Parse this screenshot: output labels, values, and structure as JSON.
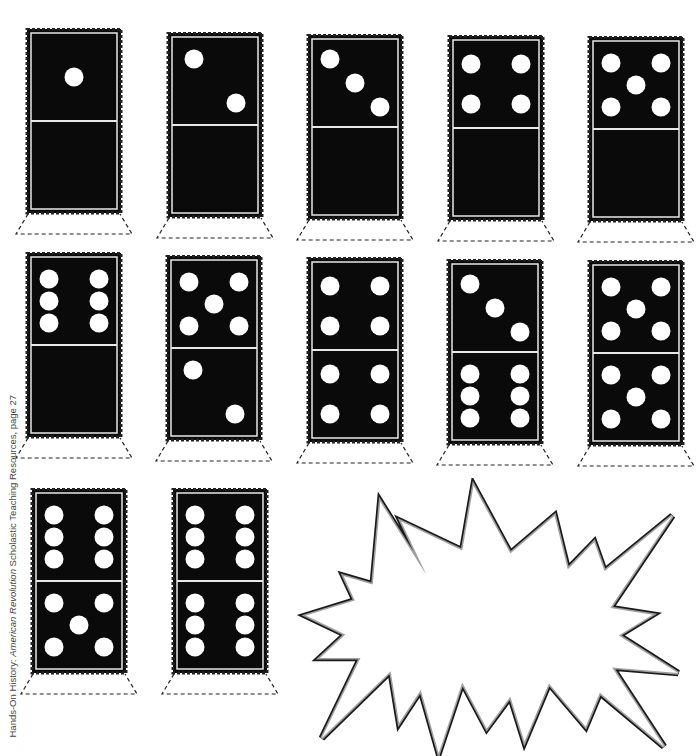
{
  "page": {
    "credit": {
      "prefix": "Hands-On History: ",
      "book": "American Revolution",
      "suffix": "  Scholastic Teaching Resources, page 27"
    }
  },
  "colors": {
    "tile": "#0a0a0a",
    "pip": "#ffffff",
    "divider": "#e8e8e8",
    "starburst_stroke": "#1a1a1a",
    "starburst_fill": "#9a9a9a"
  },
  "dominoes": [
    {
      "row": 1,
      "col": 1,
      "top": 1,
      "bottom": 0,
      "x": 26,
      "y": 28
    },
    {
      "row": 1,
      "col": 2,
      "top": 2,
      "bottom": 0,
      "x": 167,
      "y": 32
    },
    {
      "row": 1,
      "col": 3,
      "top": 3,
      "bottom": 0,
      "x": 307,
      "y": 34
    },
    {
      "row": 1,
      "col": 4,
      "top": 4,
      "bottom": 0,
      "x": 448,
      "y": 35
    },
    {
      "row": 1,
      "col": 5,
      "top": 5,
      "bottom": 0,
      "x": 588,
      "y": 36
    },
    {
      "row": 2,
      "col": 1,
      "top": 6,
      "bottom": 0,
      "x": 26,
      "y": 252
    },
    {
      "row": 2,
      "col": 2,
      "top": 5,
      "bottom": 2,
      "x": 166,
      "y": 255
    },
    {
      "row": 2,
      "col": 3,
      "top": 4,
      "bottom": 4,
      "x": 307,
      "y": 257
    },
    {
      "row": 2,
      "col": 4,
      "top": 3,
      "bottom": 6,
      "x": 447,
      "y": 259
    },
    {
      "row": 2,
      "col": 5,
      "top": 5,
      "bottom": 5,
      "x": 588,
      "y": 260
    },
    {
      "row": 3,
      "col": 1,
      "top": 6,
      "bottom": 5,
      "x": 31,
      "y": 488
    },
    {
      "row": 3,
      "col": 2,
      "top": 6,
      "bottom": 6,
      "x": 172,
      "y": 488
    }
  ],
  "starburst": {
    "label": "",
    "points": "75,30 124,108 97,51 162,82 174,13 213,85 260,45 274,102 302,73 313,104 385,45 319,143 364,150 328,172 391,212 321,206 376,290 308,233 293,269 254,223 228,285 213,237 188,271 162,222 137,297 118,230 95,265 86,210 13,281 54,196 11,196 38,171 -4,151 48,135 36,109 67,118"
  }
}
